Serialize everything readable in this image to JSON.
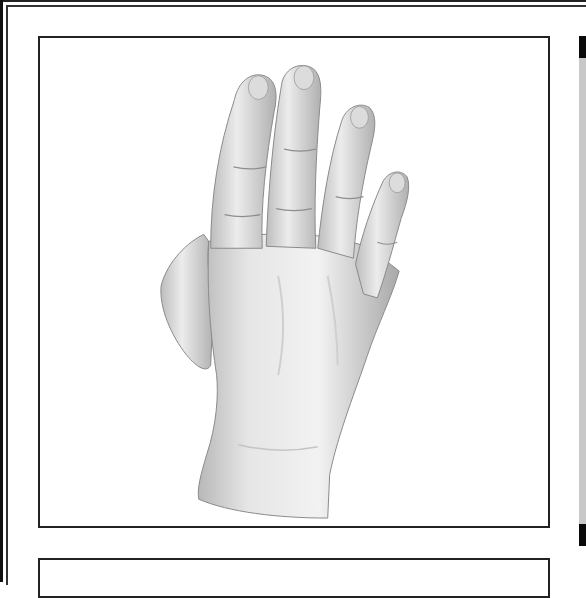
{
  "viewer": {
    "main_panel": {
      "image_description": "3D rendered left hand, back view, fingers extended upward, thumb folded",
      "image_alt": "3D hand model"
    },
    "second_panel": {},
    "scrollbar": {
      "track_color": "#c8c8c8",
      "cap_color": "#0a0a0a"
    }
  }
}
